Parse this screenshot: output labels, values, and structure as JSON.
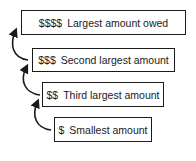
{
  "diagram": {
    "steps": [
      {
        "symbol": "$$$$",
        "label": "Largest amount owed"
      },
      {
        "symbol": "$$$",
        "label": "Second largest amount"
      },
      {
        "symbol": "$$",
        "label": "Third largest amount"
      },
      {
        "symbol": "$",
        "label": "Smallest amount"
      }
    ],
    "colors": {
      "stroke": "#1a1a1a",
      "background": "#ffffff"
    }
  }
}
